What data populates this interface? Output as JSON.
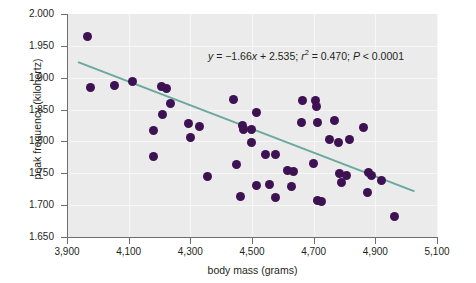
{
  "chart_data": {
    "type": "scatter",
    "title": "",
    "xlabel": "body mass (grams)",
    "ylabel": "peak frequency (kilohertz)",
    "xlim": [
      3900,
      5100
    ],
    "ylim": [
      1.65,
      2.0
    ],
    "xticks": [
      "3,900",
      "4,100",
      "4,300",
      "4,500",
      "4,700",
      "4,900",
      "5,100"
    ],
    "xtick_values": [
      3900,
      4100,
      4300,
      4500,
      4700,
      4900,
      5100
    ],
    "yticks": [
      "2.000",
      "1.950",
      "1.900",
      "1.850",
      "1.800",
      "1.750",
      "1.700",
      "1.650"
    ],
    "ytick_values": [
      2.0,
      1.95,
      1.9,
      1.85,
      1.8,
      1.75,
      1.7,
      1.65
    ],
    "grid": true,
    "legend": "none",
    "point_color": "#3d1152",
    "line_color": "#6aa89d",
    "panel_color": "#ebebeb",
    "annotation": {
      "text": "y = −1.66x + 2.535; r² = 0.470; P < 0.0001",
      "slope": -1.66,
      "intercept": 2.535,
      "r_squared": 0.47,
      "p_value": "< 0.0001",
      "eq_y": "y",
      "eq_body": " = −1.66",
      "eq_x": "x",
      "eq_tail": " + 2.535; ",
      "eq_r": "r",
      "eq_sup": "2",
      "eq_r_val": " = 0.470; ",
      "eq_p": "P",
      "eq_p_val": " < 0.0001"
    },
    "fit_line": {
      "x_start": 3936,
      "y_start": 1.9245,
      "x_end": 5027,
      "y_end": 1.7217
    },
    "points": [
      {
        "x": 3968,
        "y": 1.9645
      },
      {
        "x": 3975,
        "y": 1.884
      },
      {
        "x": 4055,
        "y": 1.8875
      },
      {
        "x": 4113,
        "y": 1.8945
      },
      {
        "x": 4205,
        "y": 1.8855
      },
      {
        "x": 4222,
        "y": 1.8835
      },
      {
        "x": 4236,
        "y": 1.859
      },
      {
        "x": 4210,
        "y": 1.842
      },
      {
        "x": 4179,
        "y": 1.817
      },
      {
        "x": 4180,
        "y": 1.7765
      },
      {
        "x": 4295,
        "y": 1.8285
      },
      {
        "x": 4300,
        "y": 1.806
      },
      {
        "x": 4330,
        "y": 1.823
      },
      {
        "x": 4356,
        "y": 1.7455
      },
      {
        "x": 4440,
        "y": 1.8665
      },
      {
        "x": 4470,
        "y": 1.8245
      },
      {
        "x": 4474,
        "y": 1.8195
      },
      {
        "x": 4497,
        "y": 1.8185
      },
      {
        "x": 4516,
        "y": 1.8455
      },
      {
        "x": 4498,
        "y": 1.799
      },
      {
        "x": 4450,
        "y": 1.7635
      },
      {
        "x": 4463,
        "y": 1.7135
      },
      {
        "x": 4545,
        "y": 1.7795
      },
      {
        "x": 4577,
        "y": 1.779
      },
      {
        "x": 4513,
        "y": 1.731
      },
      {
        "x": 4556,
        "y": 1.7325
      },
      {
        "x": 4577,
        "y": 1.712
      },
      {
        "x": 4615,
        "y": 1.7545
      },
      {
        "x": 4636,
        "y": 1.753
      },
      {
        "x": 4627,
        "y": 1.729
      },
      {
        "x": 4664,
        "y": 1.864
      },
      {
        "x": 4706,
        "y": 1.8645
      },
      {
        "x": 4708,
        "y": 1.8555
      },
      {
        "x": 4660,
        "y": 1.8295
      },
      {
        "x": 4713,
        "y": 1.829
      },
      {
        "x": 4766,
        "y": 1.8325
      },
      {
        "x": 4752,
        "y": 1.8035
      },
      {
        "x": 4780,
        "y": 1.799
      },
      {
        "x": 4815,
        "y": 1.803
      },
      {
        "x": 4700,
        "y": 1.7655
      },
      {
        "x": 4783,
        "y": 1.749
      },
      {
        "x": 4807,
        "y": 1.747
      },
      {
        "x": 4790,
        "y": 1.736
      },
      {
        "x": 4712,
        "y": 1.7075
      },
      {
        "x": 4724,
        "y": 1.706
      },
      {
        "x": 4862,
        "y": 1.8225
      },
      {
        "x": 4878,
        "y": 1.751
      },
      {
        "x": 4886,
        "y": 1.747
      },
      {
        "x": 4876,
        "y": 1.7205
      },
      {
        "x": 4920,
        "y": 1.739
      },
      {
        "x": 4962,
        "y": 1.682
      }
    ]
  }
}
